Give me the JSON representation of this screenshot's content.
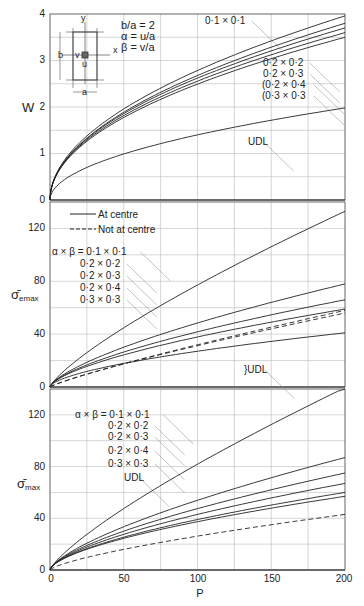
{
  "chart_data": [
    {
      "id": "top",
      "type": "line",
      "title": "",
      "xlabel": "P",
      "ylabel": "W",
      "xlim": [
        0,
        200
      ],
      "ylim": [
        0,
        4
      ],
      "yticks": [
        0,
        1,
        2,
        3,
        4
      ],
      "xgrid_step": 25,
      "ygrid_step": 0.5,
      "grid": true,
      "annotation": {
        "lines": [
          "b/a  =  2",
          "α  =  u/a",
          "β  =  v/a"
        ]
      },
      "inset": {
        "labels": {
          "y": "y",
          "x": "x",
          "b": "b",
          "v": "v",
          "u": "u",
          "a": "a"
        }
      },
      "series": [
        {
          "name": "0·1 × 0·1",
          "style": "solid",
          "c": 0.268,
          "k": 0.508,
          "end": 3.96
        },
        {
          "name": "0·2 × 0·2",
          "style": "solid",
          "c": 0.262,
          "k": 0.505,
          "end": 3.8
        },
        {
          "name": "0·2 × 0·3",
          "style": "solid",
          "c": 0.262,
          "k": 0.497,
          "end": 3.7
        },
        {
          "name": "0·2 × 0·4",
          "style": "solid",
          "c": 0.258,
          "k": 0.494,
          "end": 3.6
        },
        {
          "name": "0·3 × 0·3",
          "style": "solid",
          "c": 0.255,
          "k": 0.49,
          "end": 3.5
        },
        {
          "name": "UDL",
          "style": "solid",
          "c": 0.14,
          "k": 0.5,
          "end": 1.98
        }
      ],
      "labels": [
        {
          "text": "0·1 × 0·1",
          "x": 205,
          "y": 24
        },
        {
          "text": "0·2 × 0·2",
          "x": 263,
          "y": 66
        },
        {
          "text": "0·2 × 0·3",
          "x": 263,
          "y": 77
        },
        {
          "text": "(0·2 × 0·4",
          "x": 262,
          "y": 88
        },
        {
          "text": "(0·3 × 0·3",
          "x": 262,
          "y": 99
        },
        {
          "text": "UDL",
          "x": 248,
          "y": 145
        }
      ]
    },
    {
      "id": "middle",
      "type": "line",
      "xlabel": "",
      "ylabel": "σ̄emax",
      "xlim": [
        0,
        200
      ],
      "ylim": [
        0,
        140
      ],
      "yticks": [
        0,
        40,
        80,
        120
      ],
      "xgrid_step": 25,
      "ygrid_step": 20,
      "grid": true,
      "legend": [
        {
          "label": "At centre",
          "style": "solid"
        },
        {
          "label": "Not at centre",
          "style": "dashed"
        }
      ],
      "label_prefix": "α × β = ",
      "series": [
        {
          "name": "0·1 × 0·1",
          "style": "solid",
          "c": 2.1,
          "k": 0.785,
          "end": 133
        },
        {
          "name": "0·2 × 0·2",
          "style": "solid",
          "c": 2.05,
          "k": 0.687,
          "end": 78
        },
        {
          "name": "0·2 × 0·3",
          "style": "solid",
          "c": 2.0,
          "k": 0.66,
          "end": 66
        },
        {
          "name": "0·2 × 0·4",
          "style": "solid",
          "c": 1.95,
          "k": 0.64,
          "end": 59
        },
        {
          "name": "0·3 × 0·3",
          "style": "solid",
          "c": 1.9,
          "k": 0.6,
          "end": 41
        },
        {
          "name": "UDL (1)",
          "style": "dashed",
          "c": 0.62,
          "k": 0.86,
          "end": 58
        },
        {
          "name": "UDL (2)",
          "style": "dashed",
          "c": 0.66,
          "k": 0.84,
          "end": 56
        }
      ],
      "labels": [
        {
          "text": "α × β = 0·1 × 0·1",
          "x": 52,
          "y": 255
        },
        {
          "text": "0·2 × 0·2",
          "x": 80,
          "y": 267
        },
        {
          "text": "0·2 × 0·3",
          "x": 80,
          "y": 279
        },
        {
          "text": "0·2 × 0·4",
          "x": 80,
          "y": 291
        },
        {
          "text": "0·3 × 0·3",
          "x": 80,
          "y": 303
        },
        {
          "text": "}UDL",
          "x": 244,
          "y": 373
        }
      ]
    },
    {
      "id": "bottom",
      "type": "line",
      "xlabel": "P",
      "ylabel": "σ̄max",
      "xlim": [
        0,
        200
      ],
      "ylim": [
        0,
        140
      ],
      "xticks": [
        0,
        50,
        100,
        150,
        200
      ],
      "yticks": [
        0,
        40,
        80,
        120
      ],
      "xgrid_step": 25,
      "ygrid_step": 20,
      "grid": true,
      "series": [
        {
          "name": "0·1 × 0·1",
          "style": "solid",
          "c": 2.2,
          "k": 0.785,
          "end": 141
        },
        {
          "name": "0·2 × 0·2",
          "style": "solid",
          "c": 2.2,
          "k": 0.69,
          "end": 87
        },
        {
          "name": "0·2 × 0·3",
          "style": "solid",
          "c": 2.15,
          "k": 0.66,
          "end": 75
        },
        {
          "name": "0·2 × 0·4",
          "style": "solid",
          "c": 2.1,
          "k": 0.64,
          "end": 67
        },
        {
          "name": "0·3 × 0·3",
          "style": "solid",
          "c": 2.05,
          "k": 0.62,
          "end": 60
        },
        {
          "name": "UDL",
          "style": "solid",
          "c": 2.0,
          "k": 0.61,
          "end": 57
        },
        {
          "name": "Not at centre",
          "style": "dashed",
          "c": 0.98,
          "k": 0.715,
          "end": 43
        }
      ],
      "labels": [
        {
          "text": "α × β = 0·1 × 0·1",
          "x": 75,
          "y": 418
        },
        {
          "text": "0·2 × 0·2",
          "x": 108,
          "y": 429
        },
        {
          "text": "0·2 × 0·3",
          "x": 108,
          "y": 440
        },
        {
          "text": "0·2 × 0·4",
          "x": 108,
          "y": 454
        },
        {
          "text": "0·3 × 0·3",
          "x": 108,
          "y": 467
        },
        {
          "text": "UDL",
          "x": 124,
          "y": 481
        }
      ]
    }
  ],
  "axis": {
    "x_label": "P",
    "x_ticks": [
      "0",
      "50",
      "100",
      "150",
      "200"
    ],
    "top_y_label": "W",
    "top_y_ticks": [
      "0",
      "1",
      "2",
      "3",
      "4"
    ],
    "mid_y_label": "σ̄",
    "mid_y_sub": "emax",
    "mid_y_ticks": [
      "0",
      "40",
      "80",
      "120"
    ],
    "bot_y_label": "σ̄",
    "bot_y_sub": "max",
    "bot_y_ticks": [
      "0",
      "40",
      "80",
      "120"
    ]
  },
  "legend": {
    "solid_label": "At centre",
    "dashed_label": "Not at centre"
  },
  "annotation": {
    "ratio": "b/a  =  2",
    "alpha": "α  =  u/a",
    "beta": "β  =  v/a"
  }
}
